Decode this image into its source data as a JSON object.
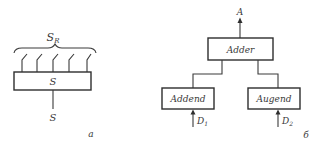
{
  "figure": {
    "panel_a": {
      "caption": "а",
      "top_label": "S",
      "top_label_sub": "R",
      "box_label": "S",
      "bottom_label": "S",
      "lead_count": 5
    },
    "panel_b": {
      "caption": "б",
      "output_label": "A",
      "nodes": [
        {
          "id": "adder",
          "label": "Adder"
        },
        {
          "id": "addend",
          "label": "Addend"
        },
        {
          "id": "augend",
          "label": "Augend"
        }
      ],
      "inputs": [
        {
          "label": "D",
          "sub": "1",
          "target": "addend"
        },
        {
          "label": "D",
          "sub": "2",
          "target": "augend"
        }
      ],
      "edges": [
        {
          "from": "addend",
          "to": "adder"
        },
        {
          "from": "augend",
          "to": "adder"
        }
      ]
    },
    "colors": {
      "line": "#3a3a3a",
      "background": "#ffffff"
    }
  }
}
